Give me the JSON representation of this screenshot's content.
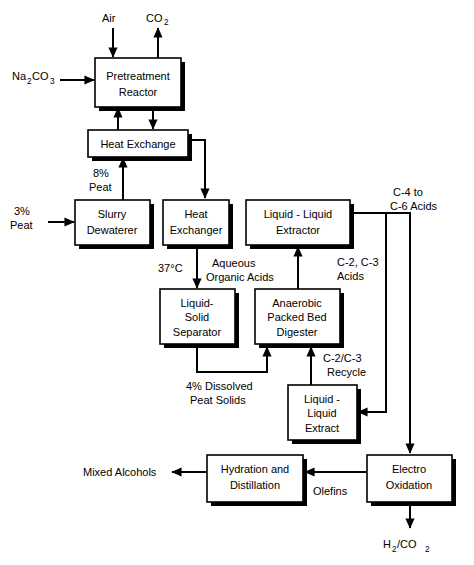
{
  "diagram": {
    "type": "process-flow-diagram",
    "line_color": "#000000",
    "box_fill": "#ffffff",
    "background": "#ffffff",
    "boxes": [
      {
        "id": "pretreatment-reactor",
        "line1": "Pretreatment",
        "line2": "Reactor"
      },
      {
        "id": "heat-exchange",
        "line1": "Heat Exchange",
        "line2": ""
      },
      {
        "id": "slurry-dewaterer",
        "line1": "Slurry",
        "line2": "Dewaterer"
      },
      {
        "id": "heat-exchanger",
        "line1": "Heat",
        "line2": "Exchanger"
      },
      {
        "id": "liquid-liquid-extractor",
        "line1": "Liquid - Liquid",
        "line2": "Extractor"
      },
      {
        "id": "liquid-solid-separator",
        "line1": "Liquid-",
        "line2": "Solid",
        "line3": "Separator"
      },
      {
        "id": "anaerobic-digester",
        "line1": "Anaerobic",
        "line2": "Packed Bed",
        "line3": "Digester"
      },
      {
        "id": "liquid-liquid-extract",
        "line1": "Liquid -",
        "line2": "Liquid",
        "line3": "Extract"
      },
      {
        "id": "hydration-distillation",
        "line1": "Hydration and",
        "line2": "Distillation"
      },
      {
        "id": "electro-oxidation",
        "line1": "Electro",
        "line2": "Oxidation"
      }
    ],
    "streams": {
      "air": "Air",
      "co2_main": "CO",
      "co2_sub": "2",
      "na2co3_a": "Na",
      "na2co3_sub1": "2",
      "na2co3_b": "CO",
      "na2co3_sub2": "3",
      "peat_8_line1": "8%",
      "peat_8_line2": "Peat",
      "peat_3_line1": "3%",
      "peat_3_line2": "Peat",
      "temperature": "37°C",
      "aqueous_line1": "Aqueous",
      "aqueous_line2": "Organic Acids",
      "c4c6_line1": "C-4 to",
      "c4c6_line2": "C-6 Acids",
      "c2c3_line1": "C-2, C-3",
      "c2c3_line2": "Acids",
      "recycle_line1": "C-2/C-3",
      "recycle_line2": "Recycle",
      "dissolved_line1": "4% Dissolved",
      "dissolved_line2": "Peat Solids",
      "mixed_alcohols": "Mixed Alcohols",
      "olefins": "Olefins",
      "h2co2_a": "H",
      "h2co2_sub1": "2",
      "h2co2_b": "/CO",
      "h2co2_sub2": "2"
    }
  }
}
